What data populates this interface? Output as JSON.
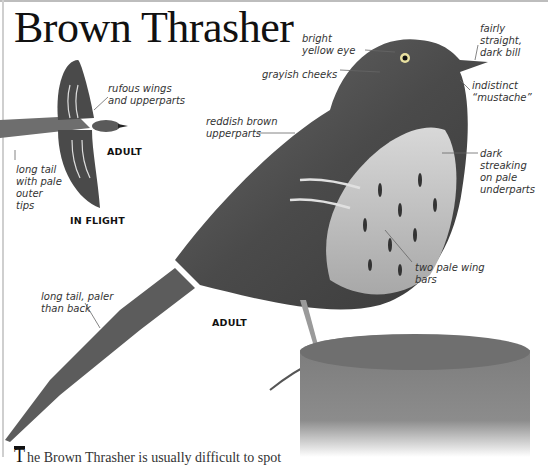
{
  "page": {
    "title": "Brown Thrasher"
  },
  "flight_figure": {
    "caption": "IN FLIGHT",
    "age_label": "ADULT",
    "annotations": [
      {
        "id": "rufous-wings",
        "text": "rufous wings\nand upperparts"
      },
      {
        "id": "long-tail-pale-tips",
        "text": "long tail\nwith pale\nouter\ntips"
      }
    ]
  },
  "main_figure": {
    "age_label": "ADULT",
    "annotations": [
      {
        "id": "bright-yellow-eye",
        "text": "bright\nyellow eye"
      },
      {
        "id": "fairly-straight-bill",
        "text": "fairly straight,\ndark bill"
      },
      {
        "id": "grayish-cheeks",
        "text": "grayish cheeks"
      },
      {
        "id": "indistinct-mustache",
        "text": "indistinct\n“mustache”"
      },
      {
        "id": "reddish-brown-upperparts",
        "text": "reddish brown\nupperparts"
      },
      {
        "id": "dark-streaking",
        "text": "dark streaking\non pale\nunderparts"
      },
      {
        "id": "two-pale-wing-bars",
        "text": "two pale wing\nbars"
      },
      {
        "id": "long-tail-paler",
        "text": "long tail, paler\nthan back"
      }
    ]
  },
  "body_text": {
    "drop_cap": "T",
    "text": "he Brown Thrasher is usually difficult to spot"
  }
}
